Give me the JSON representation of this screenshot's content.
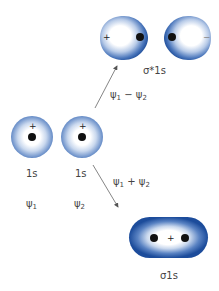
{
  "atomic_orbitals": [
    {
      "orbital": "1s",
      "wavefunction": "ψ",
      "subscript": "1",
      "sign": "+"
    },
    {
      "orbital": "1s",
      "wavefunction": "ψ",
      "subscript": "2",
      "sign": "+"
    }
  ],
  "combinations": {
    "antibonding": {
      "expression": {
        "a": "ψ",
        "a_sub": "1",
        "op": "−",
        "b": "ψ",
        "b_sub": "2"
      },
      "label": "σ*1s",
      "left_sign": "+",
      "right_sign": "−"
    },
    "bonding": {
      "expression": {
        "a": "ψ",
        "a_sub": "1",
        "op": "+",
        "b": "ψ",
        "b_sub": "2"
      },
      "label": "σ1s",
      "center_sign": "+"
    }
  },
  "colors": {
    "orbital_edge": "#1f4f9e",
    "orbital_mid": "#5e86c4",
    "orbital_core": "#ffffff",
    "nucleus": "#111111",
    "arrow": "#555555"
  }
}
